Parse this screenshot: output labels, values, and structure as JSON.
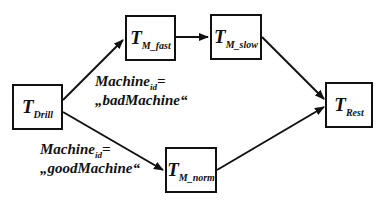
{
  "diagram": {
    "type": "process-flow",
    "nodes": [
      {
        "id": "drill",
        "main": "T",
        "sub": "Drill"
      },
      {
        "id": "m_fast",
        "main": "T",
        "sub": "M_fast"
      },
      {
        "id": "m_slow",
        "main": "T",
        "sub": "M_slow"
      },
      {
        "id": "m_norm",
        "main": "T",
        "sub": "M_norm"
      },
      {
        "id": "rest",
        "main": "T",
        "sub": "Rest"
      }
    ],
    "edges": [
      {
        "from": "drill",
        "to": "m_fast",
        "label": "bad"
      },
      {
        "from": "m_fast",
        "to": "m_slow"
      },
      {
        "from": "m_slow",
        "to": "rest"
      },
      {
        "from": "drill",
        "to": "m_norm",
        "label": "good"
      },
      {
        "from": "m_norm",
        "to": "rest"
      }
    ],
    "conditions": {
      "bad": {
        "line1_main": "Machine",
        "line1_sub": "id",
        "line1_op": "=",
        "line2": "„badMachine“"
      },
      "good": {
        "line1_main": "Machine",
        "line1_sub": "id",
        "line1_op": "=",
        "line2": "„goodMachine“"
      }
    },
    "colors": {
      "stroke": "#111111",
      "background": "#ffffff"
    }
  }
}
